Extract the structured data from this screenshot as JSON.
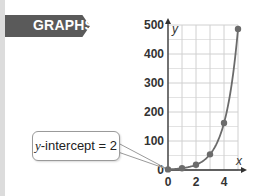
{
  "banner": {
    "label": "GRAPHS"
  },
  "callout": {
    "var": "y",
    "text": "-intercept = 2"
  },
  "colors": {
    "curve": "#6b6b6b",
    "point": "#6b6b6b",
    "grid": "#d0d0d0",
    "axis": "#333333",
    "banner": "#5a5a5a"
  },
  "chart_data": {
    "type": "line",
    "title": "",
    "function": "y = 2 * 3^x",
    "xlabel": "x",
    "ylabel": "y",
    "xlim": [
      0,
      5
    ],
    "ylim": [
      0,
      500
    ],
    "x_ticks": [
      0,
      2,
      4
    ],
    "y_ticks": [
      0,
      100,
      200,
      300,
      400,
      500
    ],
    "grid": true,
    "series": [
      {
        "name": "exponential",
        "points": [
          {
            "x": 0,
            "y": 2
          },
          {
            "x": 1,
            "y": 6
          },
          {
            "x": 2,
            "y": 18
          },
          {
            "x": 3,
            "y": 54
          },
          {
            "x": 4,
            "y": 162
          },
          {
            "x": 5,
            "y": 486
          }
        ]
      }
    ],
    "annotations": [
      {
        "text": "y-intercept = 2",
        "x": 0,
        "y": 2
      }
    ]
  }
}
